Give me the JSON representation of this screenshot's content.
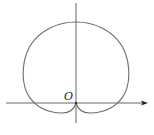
{
  "diagram": {
    "type": "polar-curve",
    "curve": "cardioid",
    "origin_label": "O",
    "colors": {
      "curve": "#6b6b6b",
      "axis": "#555555",
      "arrow": "#222222"
    }
  }
}
